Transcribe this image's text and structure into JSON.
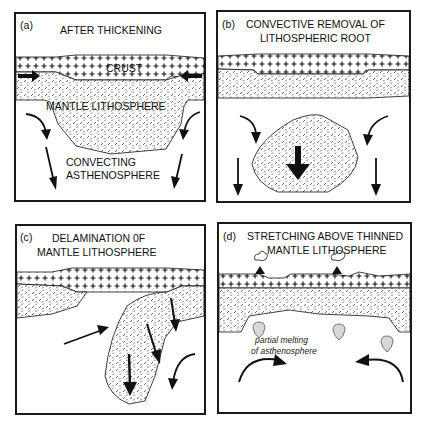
{
  "figure": {
    "panels": [
      {
        "id": "a",
        "tag": "(a)",
        "title_lines": [
          "AFTER THICKENING"
        ],
        "labels": {
          "crust": "CRUST",
          "mantle": "MANTLE LITHOSPHERE",
          "asthenosphere_line1": "CONVECTING",
          "asthenosphere_line2": "ASTHENOSPHERE"
        }
      },
      {
        "id": "b",
        "tag": "(b)",
        "title_lines": [
          "CONVECTIVE  REMOVAL OF",
          "LITHOSPHERIC ROOT"
        ]
      },
      {
        "id": "c",
        "tag": "(c)",
        "title_lines": [
          "DELAMINATION 0F",
          "MANTLE  LITHOSPHERE"
        ]
      },
      {
        "id": "d",
        "tag": "(d)",
        "title_lines": [
          "STRETCHING ABOVE THINNED",
          "MANTLE LITHOSPHERE"
        ],
        "labels": {
          "melt_line1": "partial melting",
          "melt_line2": "of asthenosphere"
        }
      }
    ],
    "legend_patterns": {
      "crust": "plus-sign pattern",
      "mantle_lithosphere": "dashed hatch pattern",
      "asthenosphere": "blank"
    },
    "colors": {
      "ink": "#111111",
      "paper": "#ffffff",
      "melt_drop": "#d8d8d8"
    }
  }
}
